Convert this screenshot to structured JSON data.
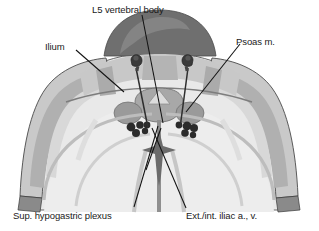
{
  "figure": {
    "type": "anatomical-cross-section",
    "view": "axial pelvis / L5 level",
    "style": "grayscale medical illustration",
    "labels": [
      {
        "id": "l5",
        "text": "L5 vertebral body",
        "position": "top-center"
      },
      {
        "id": "ilium",
        "text": "Ilium",
        "position": "upper-left"
      },
      {
        "id": "psoas",
        "text": "Psoas m.",
        "position": "upper-right"
      },
      {
        "id": "plexus",
        "text": "Sup. hypogastric plexus",
        "position": "bottom-left"
      },
      {
        "id": "iliac",
        "text": "Ext./int. iliac a., v.",
        "position": "bottom-right"
      }
    ],
    "colors": {
      "background": "#ffffff",
      "leader_line": "#121212",
      "label_text": "#1a1a1a",
      "vertebra_dark": "#6f6f6f",
      "vertebra_mid": "#8e8e8e",
      "body_light": "#e9e9e9",
      "body_lighter": "#f2f2f2",
      "muscle_mid": "#c3c3c3",
      "muscle_gray": "#aaaaaa",
      "bone_gray": "#b6b6b6",
      "outline_dark": "#3a3a3a",
      "vessel_dark": "#2a2a2a",
      "needle_dark": "#262626",
      "needle_hub": "#3d3d3d"
    },
    "structures": {
      "needles": 2,
      "vessel_clusters": 2,
      "midline_spinous": 1
    }
  }
}
